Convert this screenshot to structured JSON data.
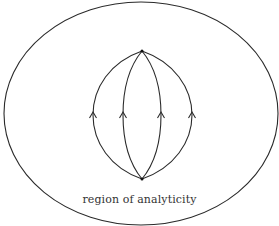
{
  "diagram": {
    "label": "region of analyticity",
    "stroke_color": "#2a2a2a",
    "outer_region": {
      "shape": "ellipse",
      "cx": 141,
      "cy": 113.5,
      "rx": 137,
      "ry": 111.5
    },
    "vertices": [
      {
        "name": "top",
        "x": 142,
        "y": 51
      },
      {
        "name": "bottom",
        "x": 142,
        "y": 179
      }
    ],
    "contours": [
      {
        "name": "contour-1",
        "mid_x": 93,
        "direction": "up"
      },
      {
        "name": "contour-2",
        "mid_x": 123,
        "direction": "up"
      },
      {
        "name": "contour-3",
        "mid_x": 161,
        "direction": "up"
      },
      {
        "name": "contour-4",
        "mid_x": 192,
        "direction": "up"
      }
    ]
  }
}
